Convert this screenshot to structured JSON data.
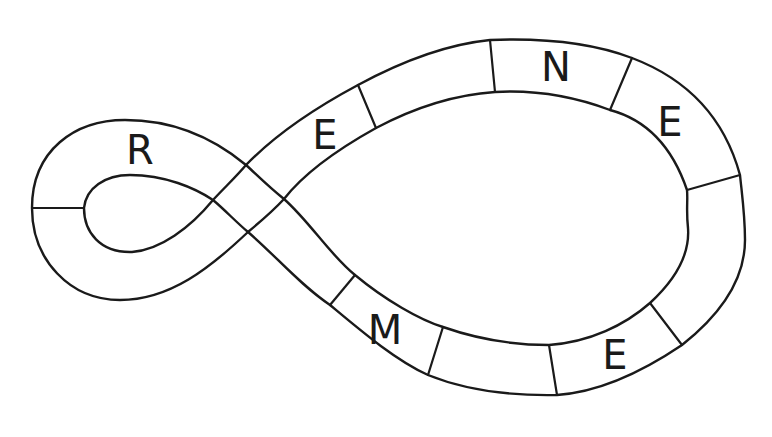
{
  "diagram": {
    "title": "",
    "stroke_color": "#1a1a1a",
    "background": "#ffffff",
    "cells": [
      {
        "id": "left-loop-upper",
        "letter": "R",
        "x": 140,
        "y": 150
      },
      {
        "id": "left-loop-lower",
        "letter": "",
        "x": 120,
        "y": 265
      },
      {
        "id": "crossing",
        "letter": "",
        "x": 248,
        "y": 198
      },
      {
        "id": "upper-1",
        "letter": "E",
        "x": 325,
        "y": 135
      },
      {
        "id": "upper-2",
        "letter": "",
        "x": 430,
        "y": 90
      },
      {
        "id": "upper-3",
        "letter": "N",
        "x": 556,
        "y": 67
      },
      {
        "id": "upper-4",
        "letter": "E",
        "x": 670,
        "y": 122
      },
      {
        "id": "right-1",
        "letter": "",
        "x": 715,
        "y": 245
      },
      {
        "id": "lower-4",
        "letter": "E",
        "x": 615,
        "y": 355
      },
      {
        "id": "lower-3",
        "letter": "",
        "x": 493,
        "y": 368
      },
      {
        "id": "lower-2",
        "letter": "M",
        "x": 385,
        "y": 330
      },
      {
        "id": "lower-1",
        "letter": "",
        "x": 300,
        "y": 270
      }
    ]
  }
}
